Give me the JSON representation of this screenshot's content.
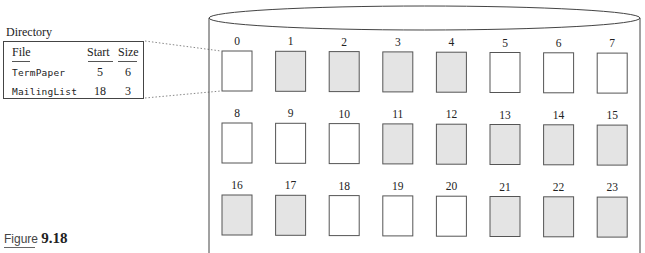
{
  "directory": {
    "title": "Directory",
    "columns": [
      "File",
      "Start",
      "Size"
    ],
    "rows": [
      {
        "file": "TermPaper",
        "start": "5",
        "size": "6"
      },
      {
        "file": "MailingList",
        "start": "18",
        "size": "3"
      }
    ]
  },
  "disk": {
    "blocks": [
      {
        "id": "0",
        "used": false
      },
      {
        "id": "1",
        "used": true
      },
      {
        "id": "2",
        "used": true
      },
      {
        "id": "3",
        "used": true
      },
      {
        "id": "4",
        "used": true
      },
      {
        "id": "5",
        "used": false
      },
      {
        "id": "6",
        "used": false
      },
      {
        "id": "7",
        "used": false
      },
      {
        "id": "8",
        "used": false
      },
      {
        "id": "9",
        "used": false
      },
      {
        "id": "10",
        "used": false
      },
      {
        "id": "11",
        "used": true
      },
      {
        "id": "12",
        "used": true
      },
      {
        "id": "13",
        "used": true
      },
      {
        "id": "14",
        "used": true
      },
      {
        "id": "15",
        "used": true
      },
      {
        "id": "16",
        "used": true
      },
      {
        "id": "17",
        "used": true
      },
      {
        "id": "18",
        "used": false
      },
      {
        "id": "19",
        "used": false
      },
      {
        "id": "20",
        "used": false
      },
      {
        "id": "21",
        "used": true
      },
      {
        "id": "22",
        "used": true
      },
      {
        "id": "23",
        "used": true
      }
    ],
    "used_fill": "#e4e4e4",
    "free_fill": "#ffffff",
    "stroke": "#555555"
  },
  "figure": {
    "prefix": "Figure",
    "number": "9.18"
  }
}
